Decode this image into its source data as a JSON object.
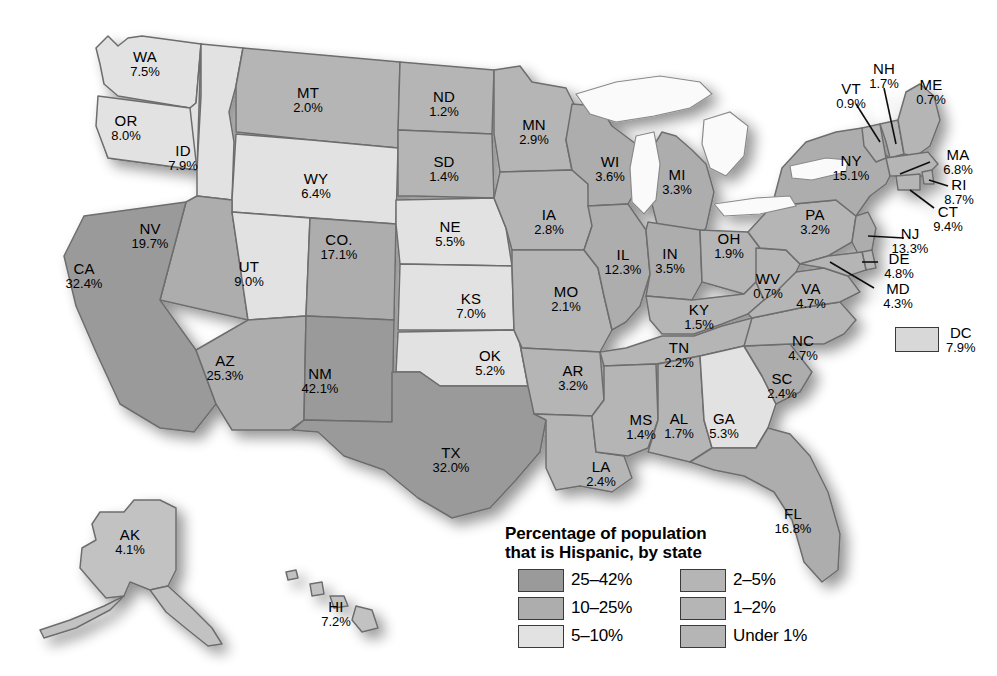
{
  "legend": {
    "title_line1": "Percentage of population",
    "title_line2": "that is Hispanic, by state",
    "classes": [
      {
        "label": "25–42%",
        "color": "#9a9a9a",
        "swatch_name": "swatch-25-42"
      },
      {
        "label": "10–25%",
        "color": "#adadad",
        "swatch_name": "swatch-10-25"
      },
      {
        "label": "5–10%",
        "color": "#e2e2e2",
        "swatch_name": "swatch-5-10"
      },
      {
        "label": "2–5%",
        "color": "#b5b5b5",
        "swatch_name": "swatch-2-5"
      },
      {
        "label": "1–2%",
        "color": "#b5b5b5",
        "swatch_name": "swatch-1-2"
      },
      {
        "label": "Under 1%",
        "color": "#b5b5b5",
        "swatch_name": "swatch-under-1"
      }
    ]
  },
  "dc": {
    "abbr": "DC",
    "value": "7.9%",
    "color": "#d8d8d8"
  },
  "chart_data": {
    "type": "heatmap",
    "title": "Percentage of population that is Hispanic, by state",
    "xlabel": "",
    "ylabel": "",
    "unit": "percent",
    "legend_position": "bottom-center",
    "grid": false,
    "bins": [
      "Under 1%",
      "1–2%",
      "2–5%",
      "5–10%",
      "10–25%",
      "25–42%"
    ],
    "categories": [
      "WA",
      "OR",
      "ID",
      "MT",
      "WY",
      "NV",
      "UT",
      "CA",
      "AZ",
      "CO",
      "NM",
      "ND",
      "SD",
      "NE",
      "KS",
      "OK",
      "TX",
      "MN",
      "IA",
      "MO",
      "AR",
      "LA",
      "WI",
      "IL",
      "MI",
      "IN",
      "OH",
      "KY",
      "TN",
      "MS",
      "AL",
      "GA",
      "FL",
      "SC",
      "NC",
      "VA",
      "WV",
      "PA",
      "NY",
      "VT",
      "NH",
      "ME",
      "MA",
      "RI",
      "CT",
      "NJ",
      "DE",
      "MD",
      "DC",
      "AK",
      "HI"
    ],
    "values": [
      7.5,
      8.0,
      7.9,
      2.0,
      6.4,
      19.7,
      9.0,
      32.4,
      25.3,
      17.1,
      42.1,
      1.2,
      1.4,
      5.5,
      7.0,
      5.2,
      32.0,
      2.9,
      2.8,
      2.1,
      3.2,
      2.4,
      3.6,
      12.3,
      3.3,
      3.5,
      1.9,
      1.5,
      2.2,
      1.4,
      1.7,
      5.3,
      16.8,
      2.4,
      4.7,
      4.7,
      0.7,
      3.2,
      15.1,
      0.9,
      1.7,
      0.7,
      6.8,
      8.7,
      9.4,
      13.3,
      4.8,
      4.3,
      7.9,
      4.1,
      7.2
    ]
  },
  "states": [
    {
      "abbr": "WA",
      "value": "7.5%",
      "x": 145,
      "y": 60
    },
    {
      "abbr": "OR",
      "value": "8.0%",
      "x": 126,
      "y": 124
    },
    {
      "abbr": "ID",
      "value": "7.9%",
      "x": 183,
      "y": 154
    },
    {
      "abbr": "MT",
      "value": "2.0%",
      "x": 308,
      "y": 96
    },
    {
      "abbr": "WY",
      "value": "6.4%",
      "x": 316,
      "y": 182
    },
    {
      "abbr": "NV",
      "value": "19.7%",
      "x": 150,
      "y": 232
    },
    {
      "abbr": "UT",
      "value": "9.0%",
      "x": 249,
      "y": 270
    },
    {
      "abbr": "CA",
      "value": "32.4%",
      "x": 84,
      "y": 272
    },
    {
      "abbr": "AZ",
      "value": "25.3%",
      "x": 225,
      "y": 364
    },
    {
      "abbr": "CO.",
      "value": "17.1%",
      "x": 339,
      "y": 243
    },
    {
      "abbr": "NM",
      "value": "42.1%",
      "x": 320,
      "y": 377
    },
    {
      "abbr": "ND",
      "value": "1.2%",
      "x": 444,
      "y": 100
    },
    {
      "abbr": "SD",
      "value": "1.4%",
      "x": 444,
      "y": 165
    },
    {
      "abbr": "NE",
      "value": "5.5%",
      "x": 450,
      "y": 230
    },
    {
      "abbr": "KS",
      "value": "7.0%",
      "x": 471,
      "y": 302
    },
    {
      "abbr": "OK",
      "value": "5.2%",
      "x": 490,
      "y": 359
    },
    {
      "abbr": "TX",
      "value": "32.0%",
      "x": 451,
      "y": 456
    },
    {
      "abbr": "MN",
      "value": "2.9%",
      "x": 534,
      "y": 128
    },
    {
      "abbr": "IA",
      "value": "2.8%",
      "x": 549,
      "y": 218
    },
    {
      "abbr": "MO",
      "value": "2.1%",
      "x": 566,
      "y": 295
    },
    {
      "abbr": "AR",
      "value": "3.2%",
      "x": 573,
      "y": 374
    },
    {
      "abbr": "LA",
      "value": "2.4%",
      "x": 601,
      "y": 470
    },
    {
      "abbr": "WI",
      "value": "3.6%",
      "x": 610,
      "y": 165
    },
    {
      "abbr": "IL",
      "value": "12.3%",
      "x": 623,
      "y": 258
    },
    {
      "abbr": "MI",
      "value": "3.3%",
      "x": 677,
      "y": 178
    },
    {
      "abbr": "IN",
      "value": "3.5%",
      "x": 670,
      "y": 257
    },
    {
      "abbr": "OH",
      "value": "1.9%",
      "x": 729,
      "y": 242
    },
    {
      "abbr": "KY",
      "value": "1.5%",
      "x": 699,
      "y": 313
    },
    {
      "abbr": "TN",
      "value": "2.2%",
      "x": 679,
      "y": 351
    },
    {
      "abbr": "MS",
      "value": "1.4%",
      "x": 641,
      "y": 423
    },
    {
      "abbr": "AL",
      "value": "1.7%",
      "x": 679,
      "y": 422
    },
    {
      "abbr": "GA",
      "value": "5.3%",
      "x": 724,
      "y": 422
    },
    {
      "abbr": "FL",
      "value": "16.8%",
      "x": 793,
      "y": 517
    },
    {
      "abbr": "SC",
      "value": "2.4%",
      "x": 782,
      "y": 382
    },
    {
      "abbr": "NC",
      "value": "4.7%",
      "x": 803,
      "y": 344
    },
    {
      "abbr": "VA",
      "value": "4.7%",
      "x": 811,
      "y": 292
    },
    {
      "abbr": "WV",
      "value": "0.7%",
      "x": 768,
      "y": 282
    },
    {
      "abbr": "PA",
      "value": "3.2%",
      "x": 815,
      "y": 218
    },
    {
      "abbr": "NY",
      "value": "15.1%",
      "x": 851,
      "y": 164
    },
    {
      "abbr": "VT",
      "value": "0.9%",
      "x": 851,
      "y": 92
    },
    {
      "abbr": "NH",
      "value": "1.7%",
      "x": 884,
      "y": 72
    },
    {
      "abbr": "ME",
      "value": "0.7%",
      "x": 931,
      "y": 88
    },
    {
      "abbr": "MA",
      "value": "6.8%",
      "x": 958,
      "y": 158
    },
    {
      "abbr": "RI",
      "value": "8.7%",
      "x": 959,
      "y": 188
    },
    {
      "abbr": "CT",
      "value": "9.4%",
      "x": 948,
      "y": 215
    },
    {
      "abbr": "NJ",
      "value": "13.3%",
      "x": 910,
      "y": 237
    },
    {
      "abbr": "DE",
      "value": "4.8%",
      "x": 899,
      "y": 262
    },
    {
      "abbr": "MD",
      "value": "4.3%",
      "x": 898,
      "y": 292
    },
    {
      "abbr": "AK",
      "value": "4.1%",
      "x": 130,
      "y": 538
    },
    {
      "abbr": "HI",
      "value": "7.2%",
      "x": 336,
      "y": 610
    }
  ]
}
